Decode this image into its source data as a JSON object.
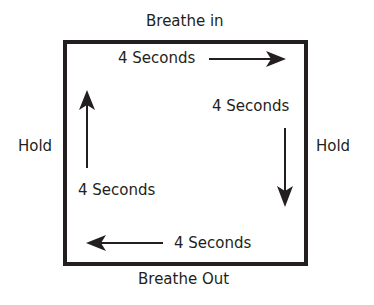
{
  "diagram": {
    "labels": {
      "top": "Breathe in",
      "bottom": "Breathe Out",
      "left": "Hold",
      "right": "Hold"
    },
    "steps": [
      {
        "side": "top",
        "duration": "4 Seconds",
        "direction": "right"
      },
      {
        "side": "right",
        "duration": "4 Seconds",
        "direction": "down"
      },
      {
        "side": "bottom",
        "duration": "4 Seconds",
        "direction": "left"
      },
      {
        "side": "left",
        "duration": "4 Seconds",
        "direction": "up"
      }
    ],
    "colors": {
      "stroke": "#231f20",
      "background": "#ffffff"
    }
  }
}
